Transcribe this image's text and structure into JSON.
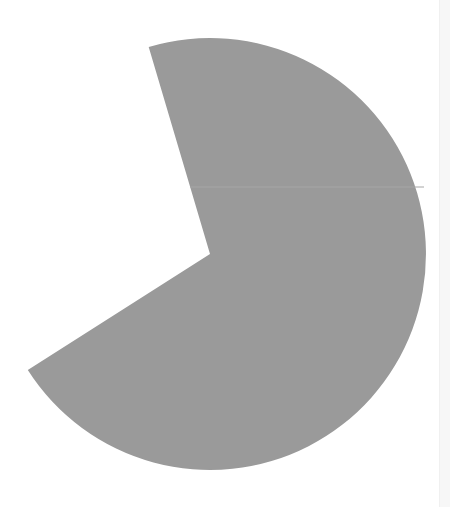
{
  "chart_data": {
    "type": "pie",
    "title": "",
    "slices": [
      {
        "label": "",
        "value": 70.6,
        "color": "#9a9a9a"
      }
    ],
    "missing_wedge_percent": 29.4,
    "center": [
      210,
      254
    ],
    "radius": 216,
    "start_angle_deg": -106.5,
    "end_angle_deg": 147.5,
    "legend": "none",
    "grid": false
  },
  "colors": {
    "slice": "#9a9a9a",
    "seam": "#a6a6a6",
    "background": "#ffffff",
    "scrollbar": "#f7f7f7"
  }
}
